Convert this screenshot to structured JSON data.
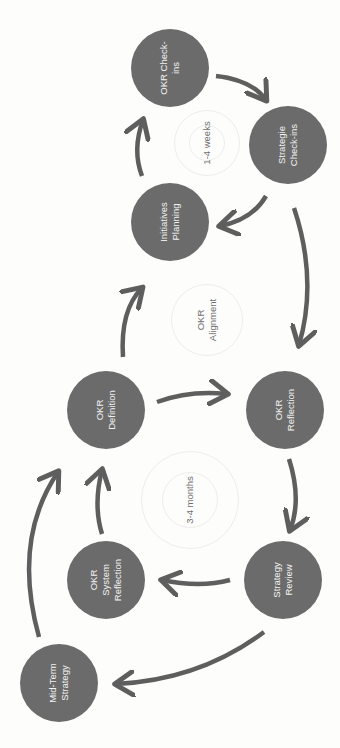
{
  "diagram": {
    "orientation": "rotated-90-ccw",
    "colors": {
      "node_fill": "#6b6b6b",
      "node_text": "#f2f2f2",
      "arrow": "#5e5e5e",
      "cycle_text": "#6e6e6e",
      "background": "#fdfdfc"
    },
    "nodes": [
      {
        "id": "okr-check-ins",
        "label": "OKR Check-\nins"
      },
      {
        "id": "strategie-check-ins",
        "label": "Strategie\nCheck-ins"
      },
      {
        "id": "initiatives-planning",
        "label": "Initiatives\nPlanning"
      },
      {
        "id": "okr-definition",
        "label": "OKR\nDefinition"
      },
      {
        "id": "okr-reflection",
        "label": "OKR\nReflection"
      },
      {
        "id": "okr-system-reflection",
        "label": "OKR\nSystem\nReflection"
      },
      {
        "id": "strategy-review",
        "label": "Strategy\nReview"
      },
      {
        "id": "mid-term-strategy",
        "label": "Mid-Term\nStrategy"
      }
    ],
    "cycles": [
      {
        "id": "weekly-cycle",
        "label": "1-4 weeks"
      },
      {
        "id": "alignment",
        "label": "OKR\nAlignment"
      },
      {
        "id": "quarterly-cycle",
        "label": "3-4 months"
      }
    ],
    "edges": [
      {
        "from": "okr-check-ins",
        "to": "strategie-check-ins"
      },
      {
        "from": "strategie-check-ins",
        "to": "initiatives-planning"
      },
      {
        "from": "initiatives-planning",
        "to": "okr-check-ins"
      },
      {
        "from": "strategie-check-ins",
        "to": "okr-reflection"
      },
      {
        "from": "okr-definition",
        "to": "initiatives-planning"
      },
      {
        "from": "okr-definition",
        "to": "okr-reflection"
      },
      {
        "from": "okr-reflection",
        "to": "strategy-review"
      },
      {
        "from": "strategy-review",
        "to": "okr-system-reflection"
      },
      {
        "from": "okr-system-reflection",
        "to": "okr-definition"
      },
      {
        "from": "strategy-review",
        "to": "mid-term-strategy"
      },
      {
        "from": "mid-term-strategy",
        "to": "okr-definition"
      }
    ]
  }
}
